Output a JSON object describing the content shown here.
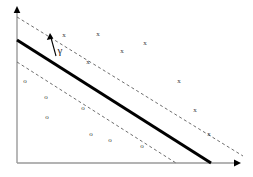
{
  "figure": {
    "background_color": "#ffffff",
    "width": 253,
    "height": 177
  },
  "axes": {
    "color": "#9a9a9a",
    "arrow_color": "#000000",
    "x_axis": {
      "x1": 17,
      "y1": 163,
      "x2": 237,
      "y2": 163,
      "name": "x-axis"
    },
    "y_axis": {
      "x1": 17,
      "y1": 163,
      "x2": 17,
      "y2": 8,
      "name": "y-axis"
    }
  },
  "lines": {
    "decision_boundary": {
      "label": "decision-boundary",
      "style": "solid",
      "color": "#000000",
      "width": 3,
      "x1": 17,
      "y1": 40,
      "x2": 211,
      "y2": 163
    },
    "upper_margin": {
      "label": "upper-margin-boundary",
      "style": "dashed",
      "color": "#6e6e6e",
      "width": 1,
      "x1": 17,
      "y1": 17,
      "x2": 243,
      "y2": 156
    },
    "lower_margin": {
      "label": "lower-margin-boundary",
      "style": "dashed",
      "color": "#6e6e6e",
      "width": 1,
      "x1": 17,
      "y1": 62,
      "x2": 176,
      "y2": 163
    }
  },
  "margin_annotation": {
    "symbol": "γ",
    "name": "gamma",
    "arrow_color": "#000000",
    "arrow_x1": 56,
    "arrow_y1": 55,
    "arrow_x2": 50,
    "arrow_y2": 34,
    "label_x": 59,
    "label_y": 50
  },
  "chart_data": {
    "type": "scatter",
    "title": "",
    "xlabel": "",
    "ylabel": "",
    "xlim": [
      0,
      253
    ],
    "ylim": [
      0,
      177
    ],
    "grid": false,
    "legend": "none",
    "series": [
      {
        "name": "positive-class",
        "marker": "x",
        "color": "#3a3a3a",
        "points": [
          {
            "x": 64,
            "y": 35
          },
          {
            "x": 98,
            "y": 34
          },
          {
            "x": 145,
            "y": 43
          },
          {
            "x": 122,
            "y": 51
          },
          {
            "x": 88,
            "y": 62
          },
          {
            "x": 179,
            "y": 81
          },
          {
            "x": 195,
            "y": 110
          },
          {
            "x": 209,
            "y": 134
          }
        ]
      },
      {
        "name": "negative-class",
        "marker": "o",
        "color": "#3a3a3a",
        "points": [
          {
            "x": 25,
            "y": 81
          },
          {
            "x": 46,
            "y": 97
          },
          {
            "x": 47,
            "y": 117
          },
          {
            "x": 83,
            "y": 108
          },
          {
            "x": 91,
            "y": 134
          },
          {
            "x": 110,
            "y": 140
          },
          {
            "x": 142,
            "y": 146
          }
        ]
      }
    ]
  }
}
